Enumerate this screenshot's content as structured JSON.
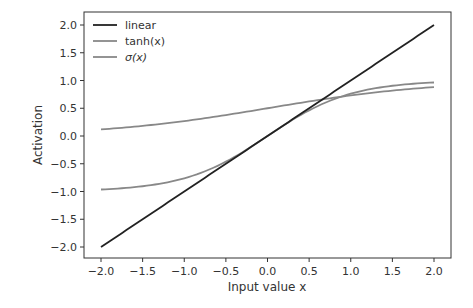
{
  "chart_data": {
    "type": "line",
    "title": "",
    "xlabel": "Input value x",
    "ylabel": "Activation",
    "xlim": [
      -2.2,
      2.2
    ],
    "ylim": [
      -2.2,
      2.2
    ],
    "xticks": [
      "−2.0",
      "−1.5",
      "−1.0",
      "−0.5",
      "0.0",
      "0.5",
      "1.0",
      "1.5",
      "2.0"
    ],
    "yticks": [
      "−2.0",
      "−1.5",
      "−1.0",
      "−0.5",
      "0.0",
      "0.5",
      "1.0",
      "1.5",
      "2.0"
    ],
    "grid": false,
    "legend_position": "upper left",
    "x": [
      -2.0,
      -1.5,
      -1.0,
      -0.5,
      0.0,
      0.5,
      1.0,
      1.5,
      2.0
    ],
    "series": [
      {
        "name": "linear",
        "color": "#222222",
        "values": [
          -2.0,
          -1.5,
          -1.0,
          -0.5,
          0.0,
          0.5,
          1.0,
          1.5,
          2.0
        ]
      },
      {
        "name": "tanh(x)",
        "color": "#888888",
        "values": [
          -0.964,
          -0.905,
          -0.762,
          -0.462,
          0.0,
          0.462,
          0.762,
          0.905,
          0.964
        ]
      },
      {
        "name": "σ(x)",
        "color": "#888888",
        "values": [
          0.119,
          0.182,
          0.269,
          0.378,
          0.5,
          0.622,
          0.731,
          0.818,
          0.881
        ]
      }
    ]
  }
}
